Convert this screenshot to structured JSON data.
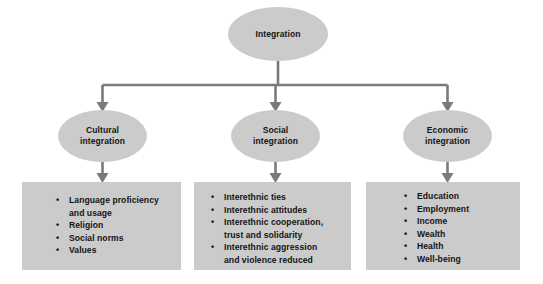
{
  "diagram": {
    "colors": {
      "node_fill": "#cbcbcb",
      "box_fill": "#cbcbcb",
      "connector": "#7a7a7a",
      "text": "#141414",
      "background": "#ffffff"
    },
    "root": {
      "label": "Integration"
    },
    "branches": [
      {
        "id": "cultural",
        "node_label": "Cultural\nintegration",
        "items": [
          "Language proficiency\nand usage",
          "Religion",
          "Social norms",
          "Values"
        ]
      },
      {
        "id": "social",
        "node_label": "Social\nintegration",
        "items": [
          "Interethnic ties",
          "Interethnic attitudes",
          "Interethnic cooperation,\ntrust and solidarity",
          "Interethnic aggression\nand violence reduced"
        ]
      },
      {
        "id": "economic",
        "node_label": "Economic\nintegration",
        "items": [
          "Education",
          "Employment",
          "Income",
          "Wealth",
          "Health",
          "Well-being"
        ]
      }
    ],
    "bullet_glyph": "•"
  }
}
